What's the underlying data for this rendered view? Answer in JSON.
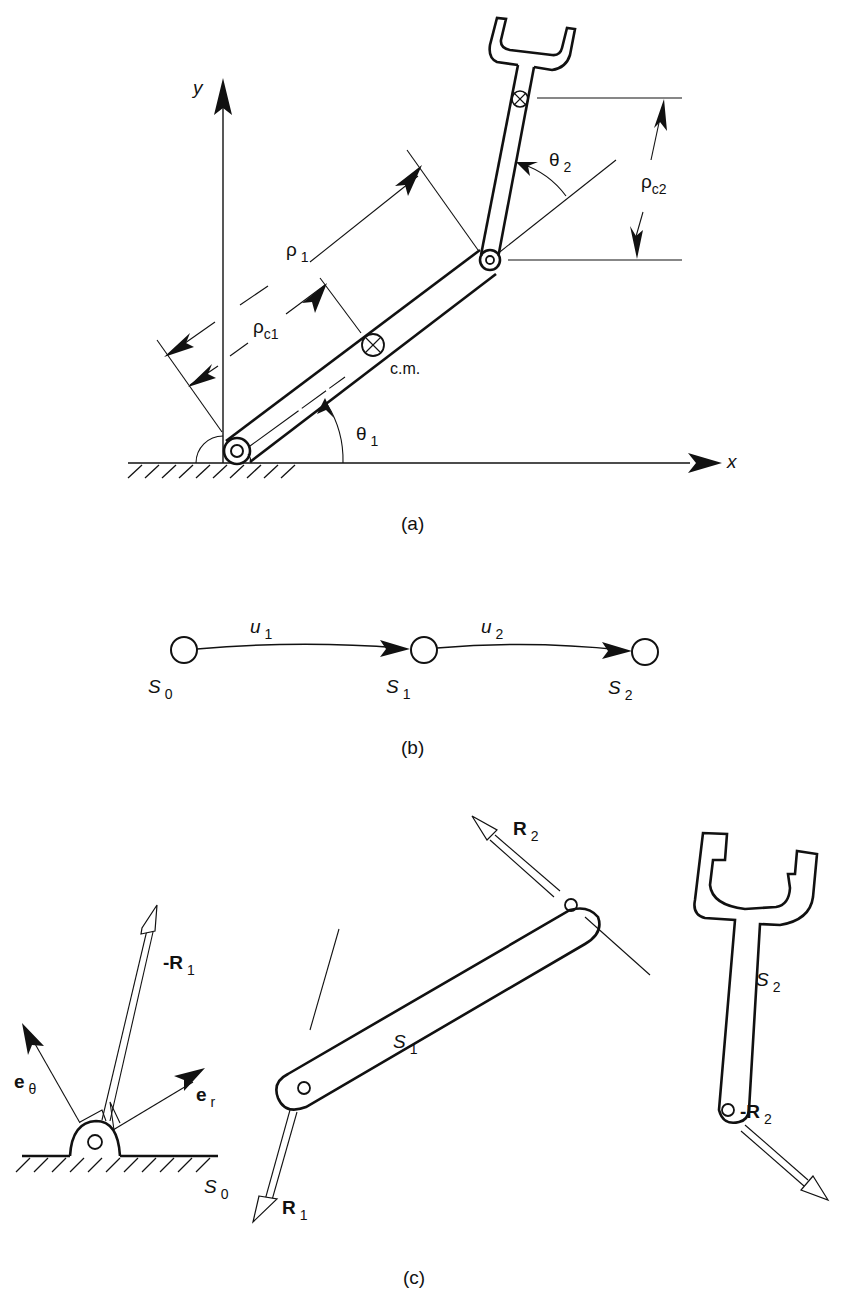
{
  "figure": {
    "panels": [
      {
        "id": "a",
        "caption": "(a)",
        "description": "Two-link planar manipulator with base pivot on ground, link 1 at angle theta1 from x-axis, link 2 (gripper) at relative angle theta2",
        "axes": {
          "x_label": "x",
          "y_label": "y"
        },
        "labels": {
          "rho1": {
            "sym": "ρ",
            "sub": "1"
          },
          "rhoc1": {
            "sym": "ρ",
            "sub": "c1"
          },
          "rhoc2": {
            "sym": "ρ",
            "sub": "c2"
          },
          "theta1": {
            "sym": "θ",
            "sub": "1"
          },
          "theta2": {
            "sym": "θ",
            "sub": "2"
          },
          "cm": "c.m."
        }
      },
      {
        "id": "b",
        "caption": "(b)",
        "description": "Chain graph of bodies connected by joints",
        "nodes": [
          {
            "sym": "S",
            "sub": "0"
          },
          {
            "sym": "S",
            "sub": "1"
          },
          {
            "sym": "S",
            "sub": "2"
          }
        ],
        "edges": [
          {
            "sym": "u",
            "sub": "1",
            "from": "S0",
            "to": "S1"
          },
          {
            "sym": "u",
            "sub": "2",
            "from": "S1",
            "to": "S2"
          }
        ]
      },
      {
        "id": "c",
        "caption": "(c)",
        "description": "Free-body diagrams of ground S0, link S1 and gripper S2 with reaction forces",
        "labels": {
          "e_theta": {
            "sym": "e",
            "sub": "θ"
          },
          "e_r": {
            "sym": "e",
            "sub": "r"
          },
          "neg_R1": {
            "sym": "-R",
            "sub": "1"
          },
          "R1": {
            "sym": "R",
            "sub": "1"
          },
          "R2": {
            "sym": "R",
            "sub": "2"
          },
          "neg_R2": {
            "sym": "-R",
            "sub": "2"
          },
          "S0": {
            "sym": "S",
            "sub": "0"
          },
          "S1": {
            "sym": "S",
            "sub": "1"
          },
          "S2": {
            "sym": "S",
            "sub": "2"
          }
        }
      }
    ]
  }
}
